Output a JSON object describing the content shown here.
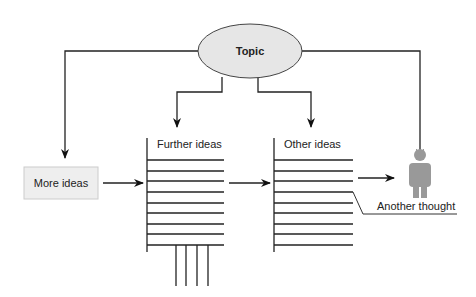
{
  "diagram": {
    "topic": {
      "label": "Topic",
      "fill": "#e6e6e6",
      "stroke": "#444444"
    },
    "more_ideas": {
      "label": "More ideas",
      "fill": "#eeeeee",
      "stroke": "#cccccc"
    },
    "further_ideas": {
      "label": "Further ideas",
      "line_count": 9,
      "leg_count": 4
    },
    "other_ideas": {
      "label": "Other ideas",
      "line_count": 9
    },
    "person": {
      "icon": "person-icon",
      "color": "#999999"
    },
    "another_thought": {
      "label": "Another thought"
    },
    "edges": [
      {
        "from": "topic",
        "to": "more_ideas"
      },
      {
        "from": "topic",
        "to": "further_ideas"
      },
      {
        "from": "topic",
        "to": "other_ideas"
      },
      {
        "from": "topic",
        "to": "person"
      },
      {
        "from": "more_ideas",
        "to": "further_ideas"
      },
      {
        "from": "further_ideas",
        "to": "other_ideas"
      },
      {
        "from": "other_ideas",
        "to": "person"
      }
    ]
  }
}
